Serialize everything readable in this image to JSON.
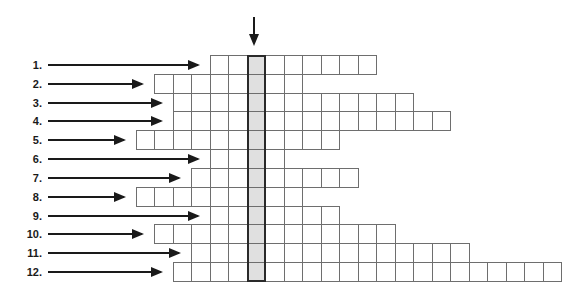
{
  "puzzle": {
    "type": "crossword-keyword-grid",
    "key_column_marker": "down-arrow",
    "colors": {
      "cell_border": "#6e6e6e",
      "key_column_fill": "#e0e0e0",
      "ink": "#1a1a1a"
    },
    "rows": [
      {
        "label": "1.",
        "left": 2,
        "right": 6
      },
      {
        "label": "2.",
        "left": 5,
        "right": 2
      },
      {
        "label": "3.",
        "left": 4,
        "right": 8
      },
      {
        "label": "4.",
        "left": 4,
        "right": 10
      },
      {
        "label": "5.",
        "left": 6,
        "right": 4
      },
      {
        "label": "6.",
        "left": 2,
        "right": 1
      },
      {
        "label": "7.",
        "left": 3,
        "right": 5
      },
      {
        "label": "8.",
        "left": 6,
        "right": 2
      },
      {
        "label": "9.",
        "left": 2,
        "right": 4
      },
      {
        "label": "10.",
        "left": 5,
        "right": 7
      },
      {
        "label": "11.",
        "left": 3,
        "right": 11
      },
      {
        "label": "12.",
        "left": 4,
        "right": 16
      }
    ]
  }
}
